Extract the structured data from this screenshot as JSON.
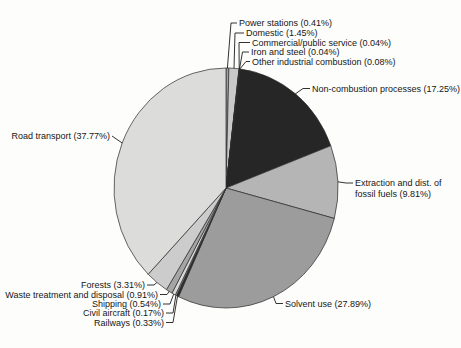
{
  "figure": {
    "kind": "scanned-pie-chart-figure",
    "background_color": "#fdfdfc",
    "text_color": "#161616",
    "outline_color": "#2b2b2b"
  },
  "chart_data": {
    "type": "pie",
    "title": "",
    "start_angle_deg": 0,
    "direction": "clockwise",
    "label_style": "callout-labels-with-leader-lines",
    "value_format": "name (percent%)",
    "series": [
      {
        "label": "Power stations",
        "value": 0.41,
        "color": "#a2a2a2"
      },
      {
        "label": "Domestic",
        "value": 1.45,
        "color": "#c9c9c9"
      },
      {
        "label": "Commercial/public service",
        "value": 0.04,
        "color": "#e3e3e3"
      },
      {
        "label": "Iron and steel",
        "value": 0.04,
        "color": "#7d7d7d"
      },
      {
        "label": "Other industrial combustion",
        "value": 0.08,
        "color": "#4a4a4a"
      },
      {
        "label": "Non-combustion processes",
        "value": 17.25,
        "color": "#262626"
      },
      {
        "label": "Extraction and dist. of fossil fuels",
        "value": 9.81,
        "color": "#b5b5b5"
      },
      {
        "label": "Solvent use",
        "value": 27.89,
        "color": "#9c9c9c"
      },
      {
        "label": "Railways",
        "value": 0.33,
        "color": "#2e2e2e"
      },
      {
        "label": "Civil aircraft",
        "value": 0.17,
        "color": "#bdbdbd"
      },
      {
        "label": "Shipping",
        "value": 0.54,
        "color": "#d8d8d8"
      },
      {
        "label": "Waste treatment and disposal",
        "value": 0.91,
        "color": "#a5a5a5"
      },
      {
        "label": "Forests",
        "value": 3.31,
        "color": "#cccccc"
      },
      {
        "label": "Road transport",
        "value": 37.77,
        "color": "#dcdcda"
      }
    ]
  }
}
